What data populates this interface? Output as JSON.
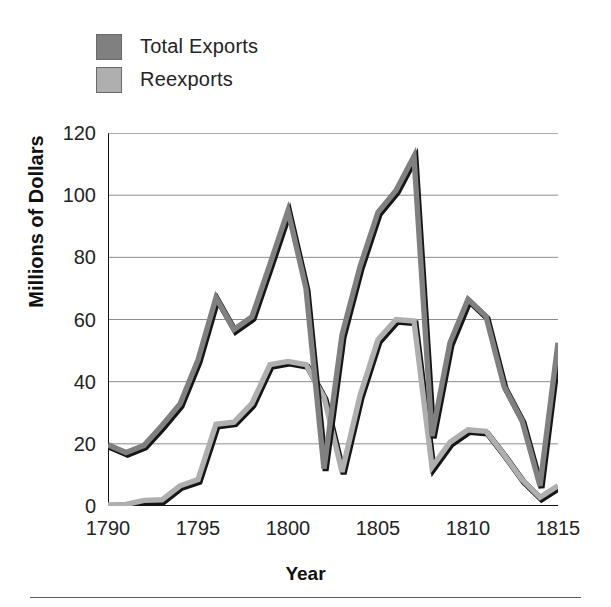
{
  "chart_data": {
    "type": "line",
    "title": "",
    "xlabel": "Year",
    "ylabel": "Millions of Dollars",
    "xlim": [
      1790,
      1815
    ],
    "ylim": [
      0,
      120
    ],
    "xticks": [
      1790,
      1795,
      1800,
      1805,
      1810,
      1815
    ],
    "yticks": [
      0,
      20,
      40,
      60,
      80,
      100,
      120
    ],
    "grid": true,
    "legend_position": "top-left-outside",
    "x": [
      1790,
      1791,
      1792,
      1793,
      1794,
      1795,
      1796,
      1797,
      1798,
      1799,
      1800,
      1801,
      1802,
      1803,
      1804,
      1805,
      1806,
      1807,
      1808,
      1809,
      1810,
      1811,
      1812,
      1813,
      1814,
      1815
    ],
    "series": [
      {
        "name": "Total Exports",
        "color": "#808080",
        "values": [
          19.7,
          17.2,
          19.5,
          25.9,
          32.8,
          47.0,
          67.0,
          56.8,
          60.9,
          77.8,
          95.0,
          70.0,
          12.0,
          55.0,
          77.0,
          94.5,
          101.5,
          112.5,
          22.5,
          52.5,
          66.5,
          61.0,
          38.5,
          27.5,
          6.5,
          52.5
        ]
      },
      {
        "name": "Reexports",
        "color": "#afafaf",
        "values": [
          0.3,
          0.5,
          1.8,
          2.0,
          6.5,
          8.5,
          26.3,
          27.0,
          33.0,
          45.5,
          46.5,
          45.5,
          35.0,
          11.0,
          35.5,
          53.5,
          60.0,
          59.5,
          12.5,
          20.5,
          24.5,
          24.0,
          16.5,
          8.5,
          2.8,
          6.5
        ]
      }
    ],
    "legend": [
      {
        "label": "Total Exports",
        "color": "#808080"
      },
      {
        "label": "Reexports",
        "color": "#afafaf"
      }
    ]
  }
}
